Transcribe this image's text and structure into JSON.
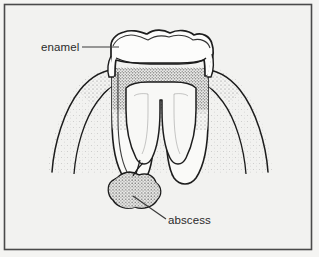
{
  "figure": {
    "name": "tooth-abscess-cross-section",
    "frame": {
      "outer_border_color": "#4a4a4a",
      "inner_background_color": "#f2f2f0"
    }
  },
  "labels": [
    {
      "id": "enamel",
      "text": "enamel",
      "x": 41,
      "y": 51,
      "leader": {
        "x1": 82,
        "y1": 47,
        "x2": 119,
        "y2": 47
      }
    },
    {
      "id": "abscess",
      "text": "abscess",
      "x": 168,
      "y": 224,
      "leader": {
        "x1": 133,
        "y1": 196,
        "x2": 166,
        "y2": 219
      }
    }
  ],
  "anatomy": {
    "enamel": "white outer crown layer with wavy cusps",
    "dentin": "stippled layer beneath enamel",
    "pulp_chamber": "light chamber inside the crown",
    "root_canals": "two U-shaped canals running down each root",
    "gum_bone": "stippled supporting tissue arcs on both sides",
    "abscess": "irregular stippled mass at the root apex"
  },
  "colors": {
    "ink": "#1d1d1d",
    "stipple_dark": "#5a5a5a",
    "stipple_light": "#9a9a9a",
    "paper": "#f2f2f0",
    "enamel_fill": "#fbfbfa",
    "pulp_fill": "#f7f7f5"
  }
}
